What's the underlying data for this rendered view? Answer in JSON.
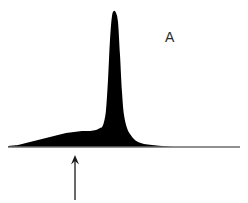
{
  "figure": {
    "panel_label": "A",
    "background_color": "#ffffff",
    "trace_color": "#000000",
    "baseline_color": "#6b6b6b",
    "annotation_color": "#1a1a1a",
    "width": 248,
    "height": 203
  },
  "annotations": {
    "arrow": {
      "name": "shoulder-arrow",
      "points_to": "shoulder",
      "tip_x": 75,
      "tip_y": 155,
      "tail_x": 75,
      "tail_y": 200,
      "direction": "up"
    },
    "panel_letter": {
      "text": "A",
      "x": 167,
      "y": 33
    }
  },
  "chart_data": {
    "type": "line",
    "title": "",
    "subtitle": "",
    "xlabel": "",
    "ylabel": "",
    "xlim": [
      0,
      248
    ],
    "ylim": [
      0,
      147
    ],
    "grid": false,
    "legend": null,
    "axis_visible": {
      "x_baseline": true,
      "y_axis": false,
      "ticks": false,
      "tick_labels": false
    },
    "baseline": {
      "y": 147,
      "x_start": 8,
      "x_end": 240
    },
    "fill": "solid-black",
    "series": [
      {
        "name": "trace",
        "description": "Tall narrow main peak with a broad low shoulder on its left side",
        "features": [
          {
            "name": "shoulder",
            "type": "broad-hump",
            "center_x": 82,
            "apex_y": 131,
            "height": 16,
            "start_x": 18,
            "end_x": 102,
            "width": 84
          },
          {
            "name": "main-peak",
            "type": "sharp-peak",
            "center_x": 114,
            "apex_y": 11,
            "height": 136,
            "start_x": 95,
            "end_x": 165,
            "half_width": 18
          }
        ],
        "x": [
          8,
          18,
          26,
          34,
          42,
          50,
          58,
          66,
          74,
          82,
          90,
          96,
          100,
          102,
          104,
          106,
          108,
          110,
          112,
          114,
          116,
          118,
          120,
          122,
          124,
          127,
          130,
          134,
          138,
          144,
          152,
          162,
          175,
          200,
          240
        ],
        "y": [
          146,
          145,
          143,
          141,
          139,
          137,
          135,
          133,
          132,
          131,
          131,
          130,
          128,
          127,
          122,
          110,
          80,
          40,
          16,
          11,
          13,
          22,
          55,
          92,
          115,
          128,
          134,
          139,
          142,
          144,
          145,
          146,
          147,
          147,
          147
        ]
      }
    ]
  }
}
